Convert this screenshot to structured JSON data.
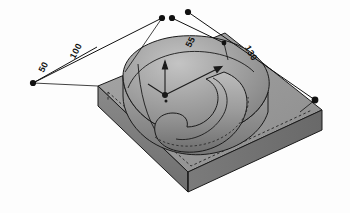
{
  "view": {
    "kind": "cad-isometric-viewport",
    "background_color": "#fdfdfd",
    "model_fill_top": "#9a9a9a",
    "model_fill_side": "#7d7d7d",
    "model_fill_highlight": "#b9b9b9",
    "edge_color": "#1a1a1a",
    "hidden_edge_color": "#2b2b2b",
    "dimension_color": "#111111"
  },
  "dimensions": [
    {
      "id": "dim-50",
      "value": "50",
      "name": "dimension-50"
    },
    {
      "id": "dim-100",
      "value": "100",
      "name": "dimension-100"
    },
    {
      "id": "dim-55",
      "value": "55",
      "name": "dimension-55"
    },
    {
      "id": "dim-130",
      "value": "130",
      "name": "dimension-130"
    }
  ],
  "handles": {
    "count": 6,
    "color": "#111111",
    "label": "dimension-endpoint-handle"
  },
  "origin_marker": {
    "label": "origin-coordinate-axes",
    "color": "#1a1a1a"
  }
}
